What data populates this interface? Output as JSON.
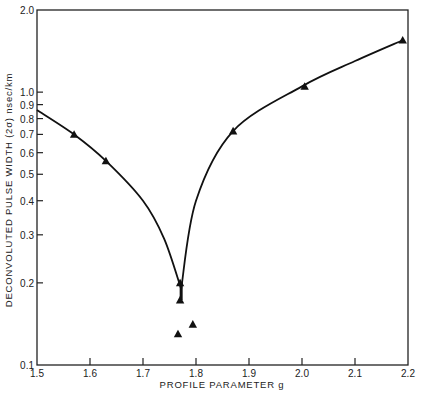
{
  "chart_data": {
    "type": "scatter",
    "title": "",
    "xlabel": "PROFILE PARAMETER g",
    "ylabel": "DECONVOLUTED PULSE WIDTH (2σ) nsec/km",
    "xlim": [
      1.5,
      2.2
    ],
    "ylim": [
      0.1,
      2.0
    ],
    "yscale": "log",
    "grid": false,
    "x_ticks": [
      "1.5",
      "1.6",
      "1.7",
      "1.8",
      "1.9",
      "2.0",
      "2.1",
      "2.2"
    ],
    "y_ticks": [
      "0.1",
      "0.2",
      "0.3",
      "0.4",
      "0.5",
      "0.6",
      "0.7",
      "0.8",
      "0.9",
      "1.0",
      "2.0"
    ],
    "series": [
      {
        "name": "measured",
        "marker": "triangle",
        "x": [
          1.57,
          1.63,
          1.77,
          1.77,
          1.766,
          1.794,
          1.87,
          2.005,
          2.19
        ],
        "y": [
          0.7,
          0.56,
          0.2,
          0.173,
          0.13,
          0.141,
          0.72,
          1.05,
          1.55
        ]
      },
      {
        "name": "theory",
        "style": "line",
        "x": [
          1.5,
          1.57,
          1.63,
          1.7,
          1.74,
          1.77,
          1.8,
          1.87,
          2.0,
          2.1,
          2.19
        ],
        "y": [
          0.86,
          0.7,
          0.56,
          0.4,
          0.29,
          0.19,
          0.4,
          0.72,
          1.05,
          1.3,
          1.55
        ]
      }
    ]
  }
}
